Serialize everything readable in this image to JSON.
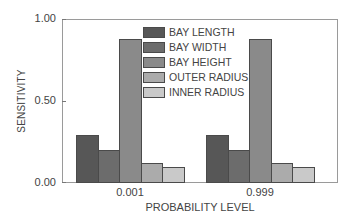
{
  "chart_data": {
    "type": "bar",
    "title": "",
    "xlabel": "PROBABILITY LEVEL",
    "ylabel": "SENSITIVITY",
    "ylim": [
      0,
      1.0
    ],
    "yticks": [
      "0.00",
      "0.50",
      "1.00"
    ],
    "categories": [
      "0.001",
      "0.999"
    ],
    "grid": false,
    "legend_position": "upper center, inside plot",
    "series": [
      {
        "name": "BAY LENGTH",
        "color": "#575757",
        "values": [
          0.29,
          0.29
        ]
      },
      {
        "name": "BAY WIDTH",
        "color": "#6c6c6c",
        "values": [
          0.2,
          0.2
        ]
      },
      {
        "name": "BAY HEIGHT",
        "color": "#8a8a8a",
        "values": [
          0.88,
          0.88
        ]
      },
      {
        "name": "OUTER RADIUS",
        "color": "#ababab",
        "values": [
          0.12,
          0.12
        ]
      },
      {
        "name": "INNER RADIUS",
        "color": "#c9c9c9",
        "values": [
          0.1,
          0.1
        ]
      }
    ]
  }
}
